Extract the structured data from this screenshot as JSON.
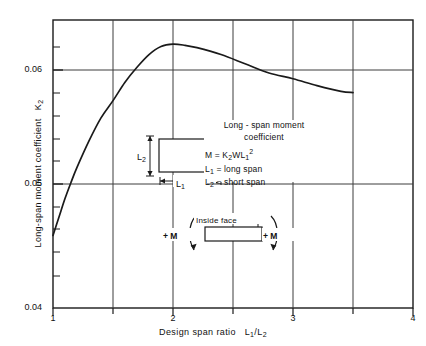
{
  "chart_data": {
    "type": "line",
    "title": "",
    "xlabel": "Design span ratio  L1/L2",
    "ylabel": "Long-span moment coefficient  K2",
    "xlim": [
      1,
      4
    ],
    "ylim": [
      0.04,
      0.065
    ],
    "grid": true,
    "legend": null,
    "x_ticks_major": [
      "1",
      "2",
      "3",
      "4"
    ],
    "x_gridlines": [
      1.5,
      2,
      2.5,
      3,
      3.5
    ],
    "y_ticks_major": [
      "0.04",
      "0.05",
      "0.06"
    ],
    "y_minor_ticks": 5,
    "series": [
      {
        "name": "Long-span moment coefficient K2",
        "x": [
          1.0,
          1.05,
          1.1,
          1.15,
          1.2,
          1.3,
          1.4,
          1.5,
          1.6,
          1.7,
          1.8,
          1.9,
          2.0,
          2.1,
          2.2,
          2.4,
          2.6,
          2.8,
          3.0,
          3.2,
          3.4,
          3.5
        ],
        "y": [
          0.0463,
          0.0479,
          0.0495,
          0.0509,
          0.0522,
          0.0545,
          0.0565,
          0.058,
          0.0596,
          0.0609,
          0.062,
          0.0627,
          0.0629,
          0.0628,
          0.0626,
          0.062,
          0.0612,
          0.0604,
          0.0599,
          0.0593,
          0.0588,
          0.0587
        ]
      }
    ]
  },
  "axes": {
    "y_labels": [
      "0.06",
      "0.05",
      "0.04"
    ],
    "x_labels": [
      "1",
      "2",
      "3",
      "4"
    ],
    "y_title_main": "Long-span moment coefficient",
    "y_title_sym": "K",
    "y_title_sub": "2",
    "x_title_main": "Design span ratio",
    "x_title_num": "L",
    "x_title_num_sub": "1",
    "x_title_slash": "/",
    "x_title_den": "L",
    "x_title_den_sub": "2"
  },
  "annotation": {
    "line1": "Long - span moment",
    "line2": "coefficient",
    "eq_m": "M = K",
    "eq_sub1": "2",
    "eq_wl": "WL",
    "eq_sub2": "1",
    "eq_sup": "2",
    "def1_sym": "L",
    "def1_sub": "1",
    "def1_text": "= long  span",
    "def2_sym": "L",
    "def2_sub": "2",
    "def2_text": "= short  span"
  },
  "plan_diagram": {
    "dim_short_sym": "L",
    "dim_short_sub": "2",
    "dim_long_sym": "L",
    "dim_long_sub": "1"
  },
  "moment_diagram": {
    "inside_face_label": "Inside face",
    "moment_left": "+ M",
    "moment_right": "+ M"
  },
  "colors": {
    "curve": "#1a1a1a",
    "axis": "#1a1a1a",
    "grid": "#4a4a4a",
    "background": "#ffffff"
  }
}
